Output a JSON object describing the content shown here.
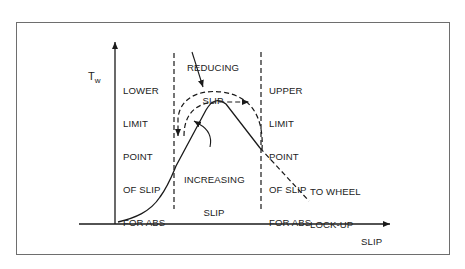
{
  "figure": {
    "y_axis_label": "T",
    "y_axis_label_subscript": "w",
    "x_axis_label": "SLIP",
    "labels": {
      "lower_limit": [
        "LOWER",
        "LIMIT",
        "POINT",
        "OF SLIP",
        "FOR ABS"
      ],
      "upper_limit": [
        "UPPER",
        "LIMIT",
        "POINT",
        "OF SLIP",
        "FOR ABS"
      ],
      "reducing_slip": [
        "REDUCING",
        "SLIP"
      ],
      "increasing_slip": [
        "INCREASING",
        "SLIP"
      ],
      "wheel_lockup": [
        "TO WHEEL",
        "LOCK-UP"
      ]
    },
    "colors": {
      "line": "#1a1a1a",
      "frame": "#6e6e6e",
      "background": "#ffffff",
      "text": "#222222"
    }
  }
}
